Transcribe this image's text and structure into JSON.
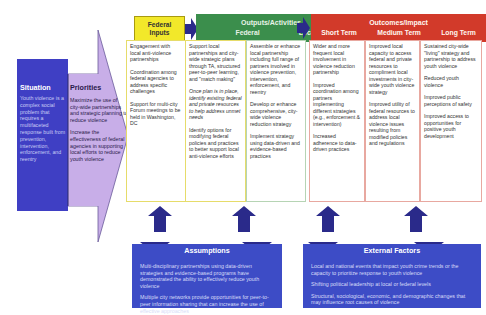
{
  "diagram": {
    "type": "logic_model",
    "colors": {
      "situation_bg": "#3f3fc4",
      "priorities_bg": "#c8a8e8",
      "inputs_header": "#f2e82a",
      "outputs_header": "#3b8e4c",
      "outcomes_header": "#d23a2a",
      "bottom_box_bg": "#3d4cc6",
      "connector_arrow": "#2a2a8a"
    }
  },
  "situation": {
    "title": "Situation",
    "text": "Youth violence is a complex social problem that requires a multifaceted response built from prevention, intervention, enforcement, and reentry"
  },
  "priorities": {
    "title": "Priorities",
    "items": [
      "Maximize the use of city-wide partnerships and strategic planning to reduce violence",
      "Increase the effectiveness of federal agencies in supporting local efforts to reduce youth violence"
    ]
  },
  "headers": {
    "inputs": {
      "line1": "Federal",
      "line2": "Inputs"
    },
    "outputs": {
      "title": "Outputs/Activities",
      "federal": "Federal",
      "local": "Local"
    },
    "outcomes": {
      "title": "Outcomes/Impact",
      "short": "Short Term",
      "medium": "Medium Term",
      "long": "Long Term"
    }
  },
  "columns": {
    "inputs": [
      "Engagement with local anti-violence partnerships",
      "Coordination among federal agencies to address specific challenges",
      "Support for multi-city Forum meetings to be held in Washington, DC"
    ],
    "outputs_federal": [
      "Support local partnerships and city-wide strategic plans through TA, structured peer-to-peer learning, and \"match making\"",
      "Once plan is in place, identify existing federal and private resources to help address unmet needs",
      "Identify options for modifying federal policies and practices to better support local anti-violence efforts"
    ],
    "outputs_local": [
      "Assemble or enhance local partnership including full range of partners involved in violence prevention, intervention, enforcement, and reentry",
      "Develop or enhance comprehensive, city-wide violence reduction strategy",
      "Implement strategy using data-driven and evidence-based practices"
    ],
    "outcomes_short": [
      "Wider and more frequent local involvement in violence reduction partnership",
      "Improved coordination among partners implementing different strategies (e.g., enforcement & intervention)",
      "Increased adherence to data-driven practices"
    ],
    "outcomes_medium": [
      "Improved local capacity to access federal and private resources to compliment local investments in city-wide youth violence strategy",
      "Improved utility of federal resources to address local violence issues resulting from modified policies and regulations"
    ],
    "outcomes_long": [
      "Sustained city-wide \"living\" strategy and partnership to address youth violence",
      "Reduced youth violence",
      "Improved public perceptions of safety",
      "Improved access to opportunities for positive youth development"
    ]
  },
  "assumptions": {
    "title": "Assumptions",
    "items": [
      "Multi-disciplinary partnerships using data-driven strategies and evidence-based programs have demonstrated the ability to effectively reduce youth violence",
      "Multiple city networks provide opportunities for peer-to-peer information sharing that can increase the use of effective approaches"
    ]
  },
  "external_factors": {
    "title": "External Factors",
    "items": [
      "Local and national events that impact youth crime trends or the capacity to prioritize response to youth violence",
      "Shifting political leadership at local or federal levels",
      "Structural, sociological, economic, and demographic changes that may influence root causes of violence"
    ]
  }
}
